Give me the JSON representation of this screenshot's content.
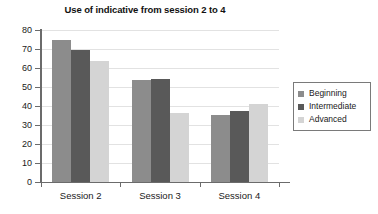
{
  "chart_data": {
    "type": "bar",
    "title": "Use of indicative from session 2 to 4",
    "xlabel": "",
    "ylabel": "",
    "categories": [
      "Session 2",
      "Session 3",
      "Session 4"
    ],
    "series": [
      {
        "name": "Beginning",
        "color": "#8c8c8c",
        "values": [
          74.5,
          53.5,
          35.5
        ]
      },
      {
        "name": "Intermediate",
        "color": "#595959",
        "values": [
          69.5,
          54.0,
          37.5
        ]
      },
      {
        "name": "Advanced",
        "color": "#d4d4d4",
        "values": [
          63.5,
          36.5,
          41.0
        ]
      }
    ],
    "ylim": [
      0,
      80
    ],
    "yticks": [
      0,
      10,
      20,
      30,
      40,
      50,
      60,
      70,
      80
    ],
    "ytick_labels": [
      "0",
      "10",
      "20",
      "30",
      "40",
      "50",
      "60",
      "70",
      "80"
    ],
    "grid": true,
    "legend_position": "right",
    "background_color": "#ffffff",
    "axis_color": "#6b6b6b",
    "grid_color": "#e2e2e2"
  }
}
